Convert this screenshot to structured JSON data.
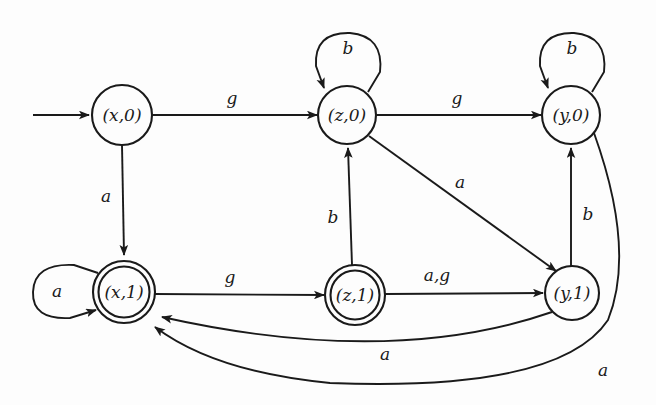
{
  "diagram": {
    "type": "state-transition-diagram",
    "background_color": "#fdfdfd",
    "stroke_color": "#1a1a1a",
    "states": [
      {
        "id": "x0",
        "label": "(x,0)",
        "cx": 122,
        "cy": 115,
        "r": 30,
        "accepting": false,
        "start": true
      },
      {
        "id": "z0",
        "label": "(z,0)",
        "cx": 347,
        "cy": 115,
        "r": 29,
        "accepting": false,
        "start": false
      },
      {
        "id": "y0",
        "label": "(y,0)",
        "cx": 571,
        "cy": 115,
        "r": 29,
        "accepting": false,
        "start": false
      },
      {
        "id": "x1",
        "label": "(x,1)",
        "cx": 124,
        "cy": 292,
        "r": 31,
        "accepting": true,
        "start": false
      },
      {
        "id": "z1",
        "label": "(z,1)",
        "cx": 355,
        "cy": 295,
        "r": 30,
        "accepting": true,
        "start": false
      },
      {
        "id": "y1",
        "label": "(y,1)",
        "cx": 572,
        "cy": 293,
        "r": 27,
        "accepting": false,
        "start": false
      }
    ],
    "transitions": [
      {
        "from": "x0",
        "to": "z0",
        "label": "g",
        "label_x": 232,
        "label_y": 99
      },
      {
        "from": "z0",
        "to": "y0",
        "label": "g",
        "label_x": 457,
        "label_y": 99
      },
      {
        "from": "z0",
        "to": "z0",
        "label": "b",
        "label_x": 348,
        "label_y": 48,
        "self_loop": true
      },
      {
        "from": "y0",
        "to": "y0",
        "label": "b",
        "label_x": 572,
        "label_y": 48,
        "self_loop": true
      },
      {
        "from": "x0",
        "to": "x1",
        "label": "a",
        "label_x": 106,
        "label_y": 197
      },
      {
        "from": "z1",
        "to": "z0",
        "label": "b",
        "label_x": 333,
        "label_y": 218
      },
      {
        "from": "z0",
        "to": "y1",
        "label": "a",
        "label_x": 460,
        "label_y": 183
      },
      {
        "from": "x1",
        "to": "x1",
        "label": "a",
        "label_x": 57,
        "label_y": 292,
        "self_loop": true
      },
      {
        "from": "x1",
        "to": "z1",
        "label": "g",
        "label_x": 230,
        "label_y": 278
      },
      {
        "from": "z1",
        "to": "y1",
        "label": "a,g",
        "label_x": 437,
        "label_y": 276
      },
      {
        "from": "y1",
        "to": "y0",
        "label": "b",
        "label_x": 588,
        "label_y": 215
      },
      {
        "from": "y1",
        "to": "x1",
        "label": "a",
        "label_x": 385,
        "label_y": 355
      },
      {
        "from": "y0",
        "to": "x1",
        "label": "a",
        "label_x": 603,
        "label_y": 371
      }
    ],
    "start_arrow": {
      "from_x": 33,
      "from_y": 115,
      "to_x": 90,
      "to_y": 115
    },
    "alphabet": [
      "a",
      "b",
      "g"
    ]
  }
}
